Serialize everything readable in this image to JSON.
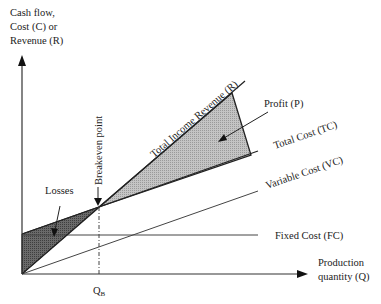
{
  "y_axis": {
    "label_lines": [
      "Cash flow,",
      "Cost (C) or",
      "Revenue (R)"
    ]
  },
  "x_axis": {
    "label_lines": [
      "Production",
      "quantity (Q)"
    ],
    "tick_label": "QB",
    "tick_label_main": "Q",
    "tick_label_sub": "B"
  },
  "lines": {
    "revenue": "Total Income Revenue (R)",
    "total_cost": "Total Cost (TC)",
    "variable_cost": "Variable Cost (VC)",
    "fixed_cost": "Fixed Cost (FC)"
  },
  "annotations": {
    "profit": "Profit (P)",
    "losses": "Losses",
    "breakeven": "Breakeven point"
  },
  "colors": {
    "axis": "#333333",
    "line": "#333333",
    "profit_fill": "#bdbdbd",
    "loss_fill": "#5f5f5f"
  }
}
